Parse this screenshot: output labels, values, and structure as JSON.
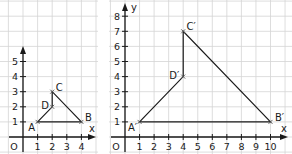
{
  "figures": [
    {
      "id": "original",
      "origin_label": "O",
      "x_axis_label": "x",
      "y_axis_label": "",
      "x_ticks": [
        "1",
        "2",
        "3",
        "4"
      ],
      "y_ticks": [
        "1",
        "2",
        "3",
        "4",
        "5"
      ],
      "points": [
        {
          "name": "A",
          "x": 1,
          "y": 1
        },
        {
          "name": "B",
          "x": 4,
          "y": 1
        },
        {
          "name": "C",
          "x": 2,
          "y": 3
        },
        {
          "name": "D",
          "x": 2,
          "y": 2
        }
      ],
      "polygon_order": [
        "A",
        "B",
        "C",
        "D"
      ]
    },
    {
      "id": "image",
      "origin_label": "O",
      "x_axis_label": "x",
      "y_axis_label": "y",
      "x_ticks": [
        "1",
        "2",
        "3",
        "4",
        "5",
        "6",
        "7",
        "8",
        "9",
        "10"
      ],
      "y_ticks": [
        "1",
        "2",
        "3",
        "4",
        "5",
        "6",
        "7",
        "8"
      ],
      "points": [
        {
          "name": "A′",
          "x": 1,
          "y": 1
        },
        {
          "name": "B′",
          "x": 10,
          "y": 1
        },
        {
          "name": "C′",
          "x": 4,
          "y": 7
        },
        {
          "name": "D′",
          "x": 4,
          "y": 4
        }
      ],
      "polygon_order": [
        "A′",
        "B′",
        "C′",
        "D′"
      ]
    }
  ],
  "colors": {
    "grid": "#d4d4d4",
    "ink": "#1a1a1a"
  }
}
